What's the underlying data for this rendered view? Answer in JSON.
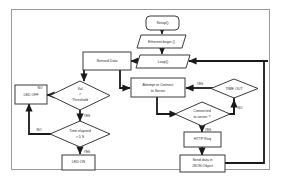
{
  "diagram": {
    "type": "flowchart",
    "frame": {
      "border_color": "#9a9a9a",
      "background": "#ffffff"
    },
    "stroke_color": "#1a1a1a",
    "node_fill": "#ffffff",
    "node_stroke": "#3a3a3a",
    "nodes": [
      {
        "id": "setup",
        "label": "Setup()",
        "shape": "rounded-rect",
        "x": 162,
        "y": 22
      },
      {
        "id": "ethernet",
        "label": "Ethernet.begin ()",
        "shape": "parallelogram",
        "x": 162,
        "y": 41
      },
      {
        "id": "loop",
        "label": "Loop()",
        "shape": "parallelogram",
        "x": 162,
        "y": 61
      },
      {
        "id": "sensed",
        "label": "Sensed Data",
        "shape": "rect",
        "x": 107,
        "y": 61
      },
      {
        "id": "threshold",
        "label": "Val > Threshold",
        "shape": "diamond",
        "x": 80,
        "y": 95
      },
      {
        "id": "ledoff",
        "label": "LED OFF",
        "shape": "rect",
        "x": 29,
        "y": 94
      },
      {
        "id": "elapsed",
        "label": "Time elapsed > 5 S",
        "shape": "diamond",
        "x": 80,
        "y": 134
      },
      {
        "id": "ledon",
        "label": "LED ON",
        "shape": "rect",
        "x": 78,
        "y": 161
      },
      {
        "id": "attempt",
        "label": "Attempt to Connect to Server",
        "shape": "rect",
        "x": 157,
        "y": 88
      },
      {
        "id": "timeout",
        "label": "TIME OUT",
        "shape": "diamond",
        "x": 234,
        "y": 88
      },
      {
        "id": "connected",
        "label": "Connected to server ?",
        "shape": "diamond",
        "x": 202,
        "y": 114
      },
      {
        "id": "httpreq",
        "label": "HTTP Req",
        "shape": "rect",
        "x": 202,
        "y": 139
      },
      {
        "id": "senddata",
        "label": "Send data in JSON Object",
        "shape": "rect",
        "x": 202,
        "y": 163
      }
    ],
    "node_labels": {
      "setup": "Setup()",
      "ethernet": "Ethernet.begin ()",
      "loop": "Loop()",
      "sensed": "Sensed Data",
      "threshold_line1": "Val",
      "threshold_line2": ">",
      "threshold_line3": "Threshold",
      "ledoff": "LED OFF",
      "elapsed_line1": "Time elapsed",
      "elapsed_line2": "> 5 S",
      "ledon": "LED ON",
      "attempt_line1": "Attempt to Connect",
      "attempt_line2": "to Server",
      "timeout": "TIME OUT",
      "connected_line1": "Connected",
      "connected_line2": "to server ?",
      "httpreq": "HTTP Req",
      "senddata_line1": "Send data in",
      "senddata_line2": "JSON Object"
    },
    "edge_labels": {
      "threshold_no": "NO",
      "threshold_yes": "YES",
      "elapsed_no": "NO",
      "elapsed_yes": "YES",
      "timeout_yes": "YES",
      "timeout_no": "NO",
      "connected_yes": "YES"
    }
  }
}
